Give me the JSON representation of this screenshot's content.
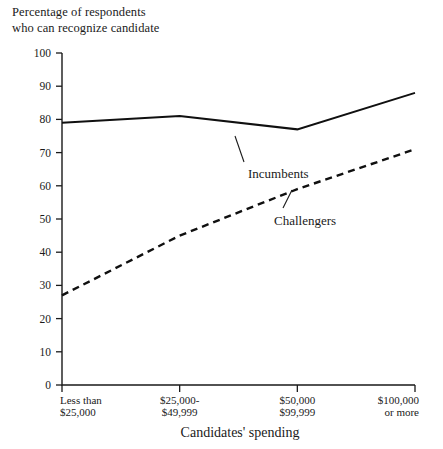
{
  "chart_data": {
    "type": "line",
    "xlabel": "Candidates' spending",
    "ylabel": "",
    "categories": [
      "Less than\n$25,000",
      "$25,000-\n$49,999",
      "$50,000\n$99,999",
      "$100,000\nor more"
    ],
    "category_lines": [
      [
        "Less than",
        "$25,000"
      ],
      [
        "$25,000-",
        "$49,999"
      ],
      [
        "$50,000",
        "$99,999"
      ],
      [
        "$100,000",
        "or more"
      ]
    ],
    "ylim": [
      0,
      100
    ],
    "yticks": [
      0,
      10,
      20,
      30,
      40,
      50,
      60,
      70,
      80,
      90,
      100
    ],
    "ytick_labels": [
      "0",
      "10",
      "20",
      "30",
      "40",
      "50",
      "60",
      "70",
      "80",
      "90",
      "100"
    ],
    "grid": false,
    "legend_position": "inline-annotations",
    "series": [
      {
        "name": "Incumbents",
        "style": "solid",
        "color": "#101010",
        "values": [
          79,
          81,
          77,
          88
        ]
      },
      {
        "name": "Challengers",
        "style": "dashed",
        "color": "#101010",
        "values": [
          27,
          45,
          59,
          71
        ]
      }
    ],
    "annotations": [
      {
        "text": "Incumbents",
        "series": "Incumbents"
      },
      {
        "text": "Challengers",
        "series": "Challengers"
      }
    ]
  },
  "colors": {
    "ink": "#101010",
    "background": "#ffffff"
  }
}
